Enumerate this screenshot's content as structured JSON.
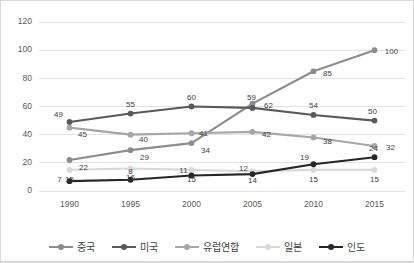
{
  "chart_data": {
    "type": "line",
    "title": "",
    "xlabel": "",
    "ylabel": "",
    "categories": [
      "1990",
      "1995",
      "2000",
      "2005",
      "2010",
      "2015"
    ],
    "ylim": [
      0,
      120
    ],
    "yticks": [
      0,
      20,
      40,
      60,
      80,
      100,
      120
    ],
    "grid": true,
    "legend_position": "bottom",
    "series": [
      {
        "name": "중국",
        "color": "#8c8c8c",
        "values": [
          22,
          29,
          34,
          62,
          85,
          100
        ]
      },
      {
        "name": "미국",
        "color": "#595959",
        "values": [
          49,
          55,
          60,
          59,
          54,
          50
        ]
      },
      {
        "name": "유럽연합",
        "color": "#a6a6a6",
        "values": [
          45,
          40,
          41,
          42,
          38,
          32
        ]
      },
      {
        "name": "일본",
        "color": "#d9d9d9",
        "values": [
          15,
          16,
          15,
          14,
          15,
          15
        ]
      },
      {
        "name": "인도",
        "color": "#262626",
        "values": [
          7,
          8,
          11,
          12,
          19,
          24
        ]
      }
    ]
  },
  "label_offsets": {
    "중국": [
      [
        14,
        10
      ],
      [
        14,
        10
      ],
      [
        14,
        10
      ],
      [
        16,
        4
      ],
      [
        14,
        5
      ],
      [
        17,
        4
      ]
    ],
    "미국": [
      [
        -11,
        -5
      ],
      [
        0,
        -7
      ],
      [
        0,
        -7
      ],
      [
        -1,
        -8
      ],
      [
        0,
        -7
      ],
      [
        -2,
        -7
      ]
    ],
    "유럽연합": [
      [
        13,
        9
      ],
      [
        13,
        7
      ],
      [
        12,
        3
      ],
      [
        14,
        5
      ],
      [
        14,
        7
      ],
      [
        16,
        4
      ]
    ],
    "일본": [
      [
        0,
        12
      ],
      [
        0,
        12
      ],
      [
        0,
        12
      ],
      [
        0,
        12
      ],
      [
        0,
        12
      ],
      [
        0,
        12
      ]
    ],
    "인도": [
      [
        -10,
        1
      ],
      [
        0,
        -6
      ],
      [
        -8,
        -3
      ],
      [
        -9,
        -3
      ],
      [
        -9,
        -4
      ],
      [
        -1,
        -6
      ]
    ]
  },
  "axis_color": "#595959",
  "grid_color": "#e2e2e2",
  "frame_border_color": "#d9d9d9"
}
